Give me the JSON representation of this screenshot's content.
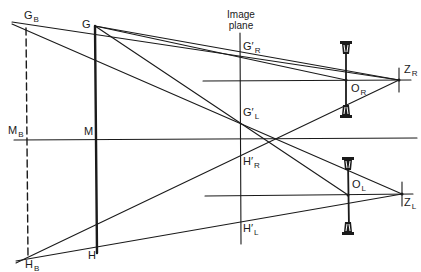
{
  "diagram": {
    "title_line1": "Image",
    "title_line2": "plane",
    "labels": {
      "GB": {
        "main": "G",
        "sub": "B"
      },
      "G": {
        "main": "G",
        "sub": ""
      },
      "MB": {
        "main": "M",
        "sub": "B"
      },
      "M": {
        "main": "M",
        "sub": ""
      },
      "H": {
        "main": "H",
        "sub": ""
      },
      "HB": {
        "main": "H",
        "sub": "B"
      },
      "GpR": {
        "main": "G′",
        "sub": "R"
      },
      "GpL": {
        "main": "G′",
        "sub": "L"
      },
      "HpR": {
        "main": "H′",
        "sub": "R"
      },
      "HpL": {
        "main": "H′",
        "sub": "L"
      },
      "OR": {
        "main": "O",
        "sub": "R"
      },
      "OL": {
        "main": "O",
        "sub": "L"
      },
      "ZR": {
        "main": "Z",
        "sub": "R"
      },
      "ZL": {
        "main": "Z",
        "sub": "L"
      }
    },
    "colors": {
      "line": "#1a1a1a",
      "background": "#ffffff"
    }
  }
}
